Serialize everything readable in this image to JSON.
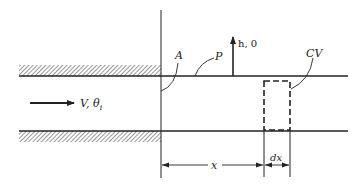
{
  "diagram": {
    "type": "channel-flow-schematic",
    "colors": {
      "line": "#222222",
      "hatch": "#444444",
      "background": "#ffffff"
    },
    "labels": {
      "inlet_flow": "V, θ",
      "inlet_flow_subscript": "i",
      "heat_flux": "h, 0",
      "region_a": "A",
      "region_p": "P",
      "control_volume": "CV",
      "distance": "x",
      "element_width": "dx"
    }
  }
}
